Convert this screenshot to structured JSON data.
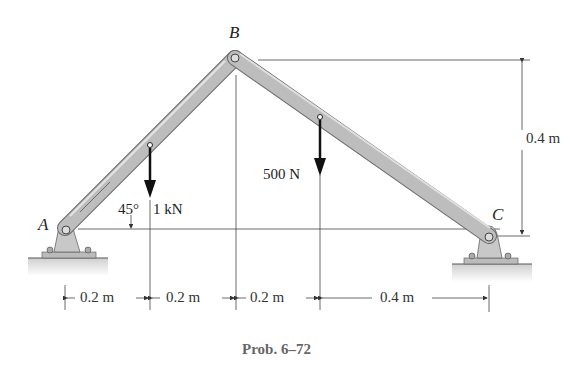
{
  "figure": {
    "caption": "Prob. 6–72",
    "points": {
      "A": "A",
      "B": "B",
      "C": "C"
    },
    "loads": [
      {
        "label": "1 kN",
        "direction": "down",
        "member": "AB"
      },
      {
        "label": "500 N",
        "direction": "down",
        "member": "BC"
      }
    ],
    "angle": {
      "label": "45°",
      "description": "member AB inclined to horizontal"
    },
    "dimensions": {
      "horizontal": [
        "0.2 m",
        "0.2 m",
        "0.2 m",
        "0.4 m"
      ],
      "vertical": "0.4 m"
    },
    "supports": [
      {
        "point": "A",
        "type": "pin"
      },
      {
        "point": "C",
        "type": "pin"
      }
    ],
    "colors": {
      "member_fill": "#bdbdbd",
      "member_edge": "#6a6a6a",
      "support_fill": "#c8c8c8",
      "ground": "#d9d9d9",
      "line": "#333333",
      "caption": "#666666"
    }
  }
}
